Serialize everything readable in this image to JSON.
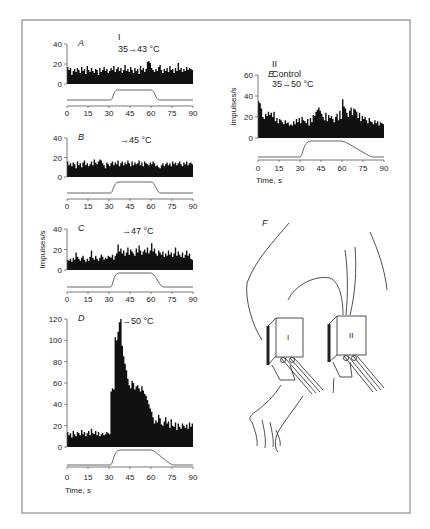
{
  "figure": {
    "frame_color": "#777777",
    "bar_color": "#111111",
    "stimulus_color": "#666666",
    "panel_F_label": "F",
    "probe_labels": [
      "I",
      "II"
    ]
  },
  "chart_data": [
    {
      "id": "A",
      "type": "bar",
      "panel_label": "A",
      "title_lines": [
        "I",
        "35→43 °C"
      ],
      "ylabel": "",
      "xlabel": "",
      "ylim": [
        0,
        40
      ],
      "yticks": [
        0,
        20,
        40
      ],
      "xticks": [
        0,
        15,
        30,
        45,
        60,
        75,
        90
      ],
      "x_range": [
        0,
        90
      ],
      "bin_s": 1,
      "values": [
        17,
        14,
        16,
        9,
        13,
        15,
        12,
        16,
        14,
        11,
        17,
        13,
        15,
        10,
        18,
        14,
        12,
        16,
        13,
        11,
        15,
        14,
        9,
        16,
        12,
        14,
        17,
        13,
        15,
        11,
        13,
        16,
        14,
        18,
        12,
        15,
        17,
        13,
        16,
        11,
        14,
        19,
        13,
        15,
        12,
        17,
        14,
        11,
        16,
        13,
        15,
        10,
        18,
        14,
        16,
        12,
        15,
        22,
        23,
        21,
        16,
        14,
        12,
        15,
        13,
        17,
        19,
        14,
        11,
        15,
        13,
        16,
        12,
        18,
        14,
        15,
        11,
        16,
        13,
        21,
        14,
        16,
        12,
        15,
        13,
        17,
        14,
        16,
        15,
        14
      ],
      "stimulus": {
        "baseline": 35,
        "peak": 43,
        "ramp_on": [
          31,
          36
        ],
        "ramp_off": [
          60,
          66
        ]
      }
    },
    {
      "id": "B",
      "type": "bar",
      "panel_label": "B",
      "title_lines": [
        "→45 °C"
      ],
      "ylabel": "",
      "xlabel": "",
      "ylim": [
        0,
        40
      ],
      "yticks": [
        0,
        20,
        40
      ],
      "xticks": [
        0,
        15,
        30,
        45,
        60,
        75,
        90
      ],
      "x_range": [
        0,
        90
      ],
      "bin_s": 1,
      "values": [
        16,
        12,
        14,
        11,
        15,
        13,
        9,
        16,
        12,
        14,
        10,
        15,
        17,
        12,
        14,
        11,
        13,
        16,
        12,
        18,
        15,
        13,
        16,
        18,
        17,
        14,
        12,
        9,
        15,
        13,
        11,
        14,
        16,
        12,
        15,
        13,
        17,
        11,
        14,
        16,
        12,
        15,
        13,
        17,
        14,
        11,
        16,
        12,
        15,
        13,
        14,
        17,
        12,
        15,
        11,
        16,
        14,
        13,
        12,
        15,
        13,
        16,
        14,
        11,
        12,
        10,
        9,
        12,
        14,
        11,
        13,
        15,
        12,
        14,
        11,
        16,
        13,
        15,
        12,
        14,
        16,
        13,
        11,
        15,
        13,
        16,
        12,
        14,
        15,
        13
      ],
      "stimulus": {
        "baseline": 35,
        "peak": 45,
        "ramp_on": [
          31,
          37
        ],
        "ramp_off": [
          60,
          67
        ]
      }
    },
    {
      "id": "C",
      "type": "bar",
      "panel_label": "C",
      "ylabel": "Impulses/s",
      "title_lines": [
        "→47 °C"
      ],
      "xlabel": "",
      "ylim": [
        0,
        40
      ],
      "yticks": [
        0,
        20,
        40
      ],
      "xticks": [
        0,
        15,
        30,
        45,
        60,
        75,
        90
      ],
      "x_range": [
        0,
        90
      ],
      "bin_s": 1,
      "values": [
        10,
        9,
        11,
        8,
        12,
        10,
        17,
        13,
        11,
        9,
        12,
        14,
        10,
        8,
        11,
        9,
        13,
        19,
        12,
        10,
        14,
        11,
        9,
        12,
        15,
        13,
        10,
        12,
        11,
        14,
        13,
        12,
        15,
        10,
        14,
        16,
        25,
        18,
        21,
        16,
        19,
        14,
        17,
        22,
        15,
        20,
        18,
        16,
        14,
        21,
        17,
        24,
        19,
        15,
        18,
        20,
        17,
        22,
        16,
        19,
        26,
        18,
        21,
        16,
        14,
        19,
        17,
        15,
        18,
        13,
        16,
        14,
        19,
        15,
        17,
        13,
        16,
        22,
        14,
        18,
        15,
        13,
        17,
        12,
        15,
        19,
        14,
        16,
        11,
        10
      ],
      "stimulus": {
        "baseline": 35,
        "peak": 47,
        "ramp_on": [
          31,
          37
        ],
        "ramp_off": [
          60,
          69
        ]
      }
    },
    {
      "id": "D",
      "type": "bar",
      "panel_label": "D",
      "title_lines": [
        "→50 °C"
      ],
      "ylabel": "",
      "xlabel": "Time, s",
      "ylim": [
        0,
        120
      ],
      "yticks": [
        0,
        20,
        40,
        60,
        80,
        100,
        120
      ],
      "xticks": [
        0,
        15,
        30,
        45,
        60,
        75,
        90
      ],
      "x_range": [
        0,
        90
      ],
      "bin_s": 1,
      "values": [
        14,
        11,
        13,
        9,
        15,
        12,
        10,
        14,
        13,
        11,
        16,
        12,
        14,
        10,
        13,
        15,
        11,
        17,
        13,
        12,
        15,
        11,
        14,
        10,
        12,
        13,
        11,
        12,
        14,
        13,
        12,
        52,
        55,
        54,
        103,
        100,
        108,
        117,
        120,
        95,
        85,
        78,
        72,
        64,
        58,
        55,
        62,
        60,
        54,
        57,
        58,
        55,
        52,
        57,
        53,
        50,
        48,
        44,
        40,
        36,
        33,
        28,
        22,
        25,
        23,
        30,
        27,
        21,
        20,
        24,
        28,
        22,
        24,
        18,
        26,
        20,
        19,
        23,
        16,
        22,
        19,
        17,
        22,
        20,
        18,
        21,
        17,
        23,
        19,
        22
      ],
      "stimulus": {
        "baseline": 35,
        "peak": 50,
        "ramp_on": [
          31,
          38
        ],
        "ramp_off": [
          60,
          76
        ]
      }
    },
    {
      "id": "E",
      "type": "bar",
      "panel_label": "E",
      "title_lines": [
        "II",
        "Control",
        "35→50 °C"
      ],
      "ylabel": "Impulses/s",
      "xlabel": "Time, s",
      "ylim": [
        0,
        60
      ],
      "yticks": [
        0,
        20,
        40,
        60
      ],
      "xticks": [
        0,
        15,
        30,
        45,
        60,
        75,
        90
      ],
      "x_range": [
        0,
        90
      ],
      "bin_s": 1,
      "values": [
        35,
        33,
        28,
        20,
        18,
        23,
        21,
        25,
        22,
        24,
        20,
        25,
        16,
        19,
        14,
        18,
        17,
        15,
        13,
        17,
        14,
        15,
        12,
        13,
        12,
        16,
        13,
        18,
        15,
        19,
        14,
        20,
        17,
        16,
        14,
        18,
        12,
        19,
        15,
        22,
        21,
        25,
        27,
        29,
        26,
        23,
        20,
        17,
        24,
        16,
        22,
        19,
        21,
        18,
        15,
        20,
        23,
        17,
        26,
        18,
        37,
        30,
        28,
        24,
        20,
        26,
        29,
        22,
        28,
        27,
        25,
        19,
        24,
        16,
        21,
        18,
        20,
        17,
        14,
        19,
        16,
        15,
        13,
        17,
        14,
        16,
        12,
        15,
        14,
        13
      ],
      "stimulus": {
        "baseline": 35,
        "peak": 50,
        "ramp_on": [
          30,
          38
        ],
        "ramp_off": [
          60,
          82
        ]
      }
    }
  ]
}
